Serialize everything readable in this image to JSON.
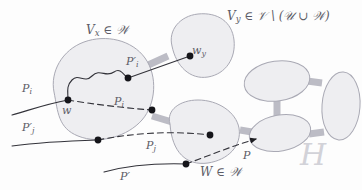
{
  "figure": {
    "name": "graph-partition-diagram",
    "background_color": "#fdfdfd",
    "blob_fill": "#eeeef1",
    "blob_stroke": "#a9a9b4",
    "connector_color": "#b9b9c2",
    "path_color": "#3a3a42",
    "label_color": "#5c5c66",
    "watermark_color": "#d2d2d8"
  },
  "labels": {
    "vx_in_w": "V",
    "vx_sub": "x",
    "vx_rest": "∈ 𝒲",
    "vy_set": "V",
    "vy_sub": "y",
    "vy_rest": "∈ 𝒱 \\ (𝒰 ∪ 𝒲)",
    "w_in_w": "W ∈ 𝒲",
    "h": "H",
    "p_i_left": "P",
    "p_i_left_sub": "i",
    "p_j_prime_left": "P",
    "p_j_prime_left_sub": "j",
    "p_i_prime_top": "P",
    "p_i_prime_top_sub": "i",
    "p_i_mid": "P",
    "p_i_mid_sub": "i",
    "p_j_mid": "P",
    "p_j_mid_sub": "j",
    "p_prime_bottom": "P",
    "p_right": "P",
    "w_node": "w",
    "wy_node": "w",
    "wy_node_sub": "y",
    "prime_mark": "′"
  },
  "nodes": [
    {
      "id": "w",
      "label": "w",
      "x": 68,
      "y": 100
    },
    {
      "id": "pi1",
      "label": "",
      "x": 128,
      "y": 78
    },
    {
      "id": "wy",
      "label": "w_y",
      "x": 190,
      "y": 56
    },
    {
      "id": "pi2",
      "label": "",
      "x": 152,
      "y": 110
    },
    {
      "id": "pj1",
      "label": "",
      "x": 98,
      "y": 140
    },
    {
      "id": "pj2",
      "label": "",
      "x": 210,
      "y": 135
    },
    {
      "id": "pp",
      "label": "",
      "x": 186,
      "y": 164
    }
  ],
  "regions": [
    {
      "id": "Vx",
      "kind": "blob",
      "label": "V_x ∈ W"
    },
    {
      "id": "Vy",
      "kind": "blob",
      "label": "V_y ∈ V \\ (U ∪ W)"
    },
    {
      "id": "W",
      "kind": "blob",
      "label": "W ∈ W"
    },
    {
      "id": "e1",
      "kind": "ellipse",
      "label": ""
    },
    {
      "id": "e2",
      "kind": "ellipse",
      "label": ""
    },
    {
      "id": "e3",
      "kind": "ellipse",
      "label": ""
    },
    {
      "id": "e4",
      "kind": "ellipse",
      "label": ""
    }
  ],
  "paths": [
    {
      "id": "Pi",
      "style": "solid-curve",
      "label": "P_i"
    },
    {
      "id": "Pi_prime",
      "style": "solid-straight",
      "label": "P_i'"
    },
    {
      "id": "Pj_prime",
      "style": "solid",
      "label": "P_j'"
    },
    {
      "id": "Pi_dash",
      "style": "dashed",
      "label": "P_i"
    },
    {
      "id": "Pj_dash",
      "style": "dashed",
      "label": "P_j"
    },
    {
      "id": "P_prime",
      "style": "solid",
      "label": "P'"
    },
    {
      "id": "P_arrow",
      "style": "dashed-arrow",
      "label": "P"
    }
  ]
}
